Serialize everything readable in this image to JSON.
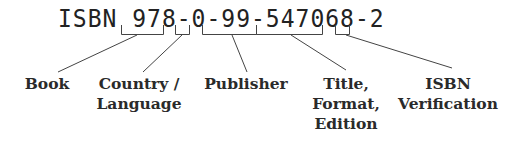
{
  "isbn": {
    "prefix": "ISBN",
    "full": "ISBN 978-0-99-547068-2",
    "segments": [
      {
        "value": "978",
        "label_lines": [
          "Book"
        ]
      },
      {
        "value": "0",
        "label_lines": [
          "Country /",
          "Language"
        ]
      },
      {
        "value": "99",
        "label_lines": [
          "Publisher"
        ]
      },
      {
        "value": "547068",
        "label_lines": [
          "Title,",
          "Format,",
          "Edition"
        ]
      },
      {
        "value": "2",
        "label_lines": [
          "ISBN",
          "Verification"
        ]
      }
    ]
  },
  "colors": {
    "text": "#2a2a2a",
    "lines": "#444444",
    "background": "#ffffff"
  }
}
